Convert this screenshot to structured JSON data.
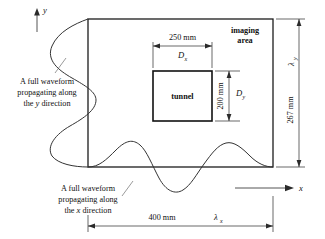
{
  "figure": {
    "axes": {
      "y_label": "y",
      "x_label": "x"
    },
    "regions": {
      "imaging_area_label_line1": "imaging",
      "imaging_area_label_line2": "area",
      "tunnel_label": "tunnel"
    },
    "dimensions": {
      "tunnel_width_mm": "250 mm",
      "tunnel_width_symbol": "D",
      "tunnel_width_symbol_sub": "x",
      "tunnel_height_mm": "200 mm",
      "tunnel_height_symbol": "D",
      "tunnel_height_symbol_sub": "y",
      "area_width_mm": "400 mm",
      "area_width_symbol": "λ",
      "area_width_symbol_sub": "x",
      "area_height_mm": "267 mm",
      "area_height_symbol": "λ",
      "area_height_symbol_sub": "y"
    },
    "annotations": {
      "y_wave": {
        "line1": "A full waveform",
        "line2": "propagating along",
        "line3_pre": "the ",
        "line3_italic": "y",
        "line3_post": " direction"
      },
      "x_wave": {
        "line1": "A full waveform",
        "line2": "propagating along",
        "line3_pre": "the ",
        "line3_italic": "x",
        "line3_post": " direction"
      }
    },
    "colors": {
      "stroke": "#1c1c1c",
      "wave": "#333333",
      "dimension": "#2a2a2a",
      "background": "#ffffff"
    }
  }
}
